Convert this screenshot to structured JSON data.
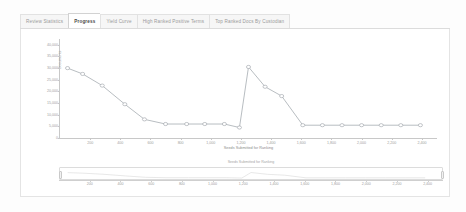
{
  "tabs": [
    {
      "label": "Review Statistics",
      "active": false
    },
    {
      "label": "Progress",
      "active": true
    },
    {
      "label": "Yield Curve",
      "active": false
    },
    {
      "label": "High Ranked Positive Terms",
      "active": false
    },
    {
      "label": "Top Ranked Docs By Custodian",
      "active": false
    }
  ],
  "navigator": {
    "title": "Seeds Submitted for Ranking",
    "left_handle": "navigator-left-handle",
    "right_handle": "navigator-right-handle",
    "xticks": [
      "200",
      "400",
      "600",
      "800",
      "1,000",
      "1,200",
      "1,400",
      "1,600",
      "1,800",
      "2,000",
      "2,200",
      "2,400"
    ]
  },
  "colors": {
    "series_line": "#9aa0a6",
    "axis": "#c8c8c8",
    "tick_text": "#9d9d9d",
    "panel_border": "#e4e4e4",
    "active_tab_text": "#4a4a4a",
    "inactive_tab_text": "#9a9a9a"
  },
  "chart_data": {
    "type": "line",
    "title": "",
    "xlabel": "Seeds Submitted for Ranking",
    "ylabel": "Documents",
    "xlim": [
      0,
      2500
    ],
    "ylim": [
      0,
      42500
    ],
    "xticks": [
      "200",
      "400",
      "600",
      "800",
      "1,000",
      "1,200",
      "1,400",
      "1,600",
      "1,800",
      "2,000",
      "2,200",
      "2,400"
    ],
    "xtick_values": [
      200,
      400,
      600,
      800,
      1000,
      1200,
      1400,
      1600,
      1800,
      2000,
      2200,
      2400
    ],
    "yticks": [
      "40,000",
      "35,000",
      "30,000",
      "25,000",
      "20,000",
      "15,000",
      "10,000",
      "5,000",
      "0"
    ],
    "ytick_values": [
      40000,
      35000,
      30000,
      25000,
      20000,
      15000,
      10000,
      5000,
      0
    ],
    "grid": false,
    "legend": false,
    "markers": "circle",
    "series": [
      {
        "name": "Documents",
        "x": [
          50,
          150,
          280,
          430,
          560,
          700,
          840,
          960,
          1090,
          1190,
          1250,
          1360,
          1470,
          1610,
          1740,
          1870,
          2000,
          2130,
          2260,
          2390
        ],
        "values": [
          30000,
          27500,
          22500,
          14500,
          8000,
          6000,
          6000,
          6000,
          6000,
          4500,
          30500,
          22000,
          18000,
          5500,
          5500,
          5500,
          5500,
          5500,
          5500,
          5500
        ]
      }
    ]
  }
}
